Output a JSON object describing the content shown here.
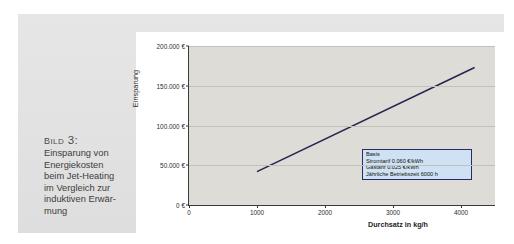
{
  "caption": {
    "title": "Bild 3:",
    "lines": [
      "Einsparung von",
      "Energiekosten",
      "beim Jet-Heating",
      "im Vergleich zur",
      "induktiven Erwär-",
      "mung"
    ]
  },
  "colors": {
    "panel_background": "#e2e2e2",
    "card_background": "#ffffff",
    "plot_background": "#dedcd6",
    "series_line": "#2b2252",
    "legend_background": "#cfe2f3",
    "legend_border": "#2a2a6a",
    "axis": "#3a3a3a",
    "gridline": "#c3c1bb"
  },
  "chart_data": {
    "type": "line",
    "title": "",
    "xlabel": "Durchsatz in kg/h",
    "ylabel": "Einsparung",
    "xlim": [
      0,
      4500
    ],
    "ylim": [
      0,
      200000
    ],
    "grid": true,
    "legend_position": "inside-bottom-right",
    "x_ticks": [
      0,
      1000,
      2000,
      3000,
      4000
    ],
    "x_tick_labels": [
      "0",
      "1000",
      "2000",
      "3000",
      "4000"
    ],
    "y_ticks": [
      0,
      50000,
      100000,
      150000,
      200000
    ],
    "y_tick_labels": [
      "0 €",
      "50.000 €",
      "100.000 €",
      "150.000 €",
      "200.000 €"
    ],
    "series": [
      {
        "name": "Einsparung",
        "color": "#2b2252",
        "x": [
          1000,
          4200
        ],
        "values": [
          42000,
          173000
        ]
      }
    ]
  },
  "legend": {
    "title": "Basis",
    "entries": [
      {
        "label": "Stromtarif",
        "value": "0.060 €/kWh"
      },
      {
        "label": "Gastarif",
        "value": "0.025 €/kWh"
      },
      {
        "label": "Jährliche Betriebszeit",
        "value": "6000 h"
      }
    ]
  }
}
